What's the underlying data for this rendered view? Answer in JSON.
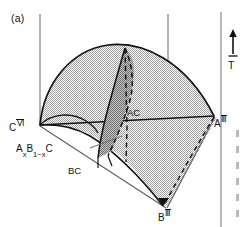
{
  "figure": {
    "panel_label": "(a)",
    "temperature_axis_label": "T",
    "vertices": [
      {
        "name": "vertex-c",
        "base": "C",
        "superscript": "Ⅵ",
        "x": 14,
        "y": 121
      },
      {
        "name": "vertex-a",
        "base": "A",
        "superscript": "Ⅲ",
        "x": 216,
        "y": 117
      },
      {
        "name": "vertex-b",
        "base": "B",
        "superscript": "Ⅲ",
        "x": 163,
        "y": 211
      }
    ],
    "binary_labels": [
      {
        "name": "phase-ac",
        "text": "AC",
        "x": 126,
        "y": 112
      },
      {
        "name": "phase-bc",
        "text": "BC",
        "x": 68,
        "y": 170
      }
    ],
    "alloy_label": {
      "prefix": "A",
      "sub1": "x",
      "mid": "B",
      "sub2": "1−x",
      "suffix": "C",
      "x": 16,
      "y": 148
    },
    "colors": {
      "line": "#121212",
      "dome_fill": "#d6d6d6",
      "wedge_fill": "#a8a8a8",
      "axis": "#6e6e6e",
      "background": "#ffffff"
    },
    "geometry": {
      "dome_apex": {
        "x": 125,
        "y": 48
      },
      "axis_left_x": 40,
      "axis_right_x": 168,
      "dither_pattern": "halftone-checker"
    }
  }
}
